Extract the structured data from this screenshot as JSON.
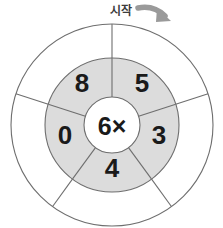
{
  "figure": {
    "name": "multiplication-wheel",
    "start_label": "시작",
    "center_label": "6×",
    "colors": {
      "ring_fill": "#dcdcdc",
      "outer_ring_fill": "#ffffff",
      "hub_fill": "#ffffff",
      "stroke": "#6e6e6e",
      "number_color": "#1a1a1a",
      "arrow_color": "#9a9a9a",
      "label_color": "#3c3c3c"
    },
    "geometry": {
      "center_x": 112,
      "center_y": 125,
      "outer_radius": 101,
      "ring_outer_radius": 67,
      "hub_radius": 28,
      "segment_count": 5
    },
    "segments": [
      {
        "position": "top-left",
        "value": "8",
        "label_x": 82,
        "label_y": 83
      },
      {
        "position": "top-right",
        "value": "5",
        "label_x": 142,
        "label_y": 83
      },
      {
        "position": "right",
        "value": "3",
        "label_x": 159,
        "label_y": 135
      },
      {
        "position": "bottom",
        "value": "4",
        "label_x": 112,
        "label_y": 168
      },
      {
        "position": "left",
        "value": "0",
        "label_x": 65,
        "label_y": 135
      }
    ],
    "arrow": {
      "name": "clockwise-rotation-arrow",
      "direction": "clockwise"
    }
  }
}
